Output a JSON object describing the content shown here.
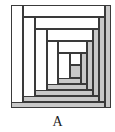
{
  "diagram": {
    "type": "log-cabin-quilt-block",
    "label": "A",
    "colors": {
      "light": "#ffffff",
      "dark": "#c8c8c8",
      "outline": "#3a3a3a"
    },
    "strips": [
      {
        "id": "r1-left",
        "x": 11,
        "y": 5,
        "w": 12,
        "h": 103,
        "shade": "light"
      },
      {
        "id": "r1-top",
        "x": 23,
        "y": 5,
        "w": 82,
        "h": 12,
        "shade": "light"
      },
      {
        "id": "r1-right",
        "x": 105,
        "y": 5,
        "w": 6,
        "h": 103,
        "shade": "dark"
      },
      {
        "id": "r1-bottom",
        "x": 11,
        "y": 102,
        "w": 94,
        "h": 6,
        "shade": "dark"
      },
      {
        "id": "r2-left",
        "x": 23,
        "y": 17,
        "w": 12,
        "h": 85,
        "shade": "light"
      },
      {
        "id": "r2-top",
        "x": 35,
        "y": 17,
        "w": 64,
        "h": 12,
        "shade": "light"
      },
      {
        "id": "r2-right",
        "x": 99,
        "y": 17,
        "w": 6,
        "h": 85,
        "shade": "dark"
      },
      {
        "id": "r2-bottom",
        "x": 23,
        "y": 96,
        "w": 76,
        "h": 6,
        "shade": "dark"
      },
      {
        "id": "r3-left",
        "x": 35,
        "y": 29,
        "w": 12,
        "h": 67,
        "shade": "light"
      },
      {
        "id": "r3-top",
        "x": 47,
        "y": 29,
        "w": 46,
        "h": 12,
        "shade": "light"
      },
      {
        "id": "r3-right",
        "x": 93,
        "y": 29,
        "w": 6,
        "h": 67,
        "shade": "dark"
      },
      {
        "id": "r3-bottom",
        "x": 35,
        "y": 90,
        "w": 58,
        "h": 6,
        "shade": "dark"
      },
      {
        "id": "r4-left",
        "x": 47,
        "y": 41,
        "w": 11,
        "h": 49,
        "shade": "light"
      },
      {
        "id": "r4-top",
        "x": 58,
        "y": 41,
        "w": 29,
        "h": 12,
        "shade": "light"
      },
      {
        "id": "r4-right",
        "x": 87,
        "y": 41,
        "w": 6,
        "h": 49,
        "shade": "dark"
      },
      {
        "id": "r4-bottom",
        "x": 47,
        "y": 84,
        "w": 40,
        "h": 6,
        "shade": "dark"
      },
      {
        "id": "r5-left",
        "x": 58,
        "y": 53,
        "w": 12,
        "h": 31,
        "shade": "light"
      },
      {
        "id": "r5-top",
        "x": 70,
        "y": 53,
        "w": 11,
        "h": 12,
        "shade": "light"
      },
      {
        "id": "r5-right",
        "x": 81,
        "y": 53,
        "w": 6,
        "h": 31,
        "shade": "dark"
      },
      {
        "id": "r5-bottom",
        "x": 58,
        "y": 78,
        "w": 23,
        "h": 6,
        "shade": "dark"
      },
      {
        "id": "center",
        "x": 70,
        "y": 65,
        "w": 11,
        "h": 13,
        "shade": "dark"
      }
    ]
  }
}
